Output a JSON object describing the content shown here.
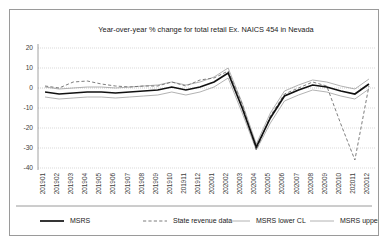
{
  "chart_data": {
    "type": "line",
    "title": "Year-over-year % change for total retail Ex. NAICS 454 in Nevada",
    "xlabel": "",
    "ylabel": "",
    "ylim": [
      -40,
      20
    ],
    "yticks": [
      20,
      10,
      0,
      -10,
      -20,
      -30,
      -40
    ],
    "ytick_labels": [
      "20",
      "10",
      "0",
      "-10",
      "-20",
      "-30",
      "-40"
    ],
    "grid": true,
    "legend_position": "bottom",
    "categories": [
      "201901",
      "201902",
      "201903",
      "201904",
      "201905",
      "201906",
      "201907",
      "201908",
      "201909",
      "201910",
      "201911",
      "201912",
      "202001",
      "202002",
      "202003",
      "202004",
      "202005",
      "202006",
      "202007",
      "202008",
      "202009",
      "202010",
      "202011",
      "202012"
    ],
    "series": [
      {
        "name": "MSRS",
        "style": "solid-thick",
        "color": "#111111",
        "values": [
          -2.0,
          -3.0,
          -2.5,
          -2.0,
          -2.0,
          -2.5,
          -2.0,
          -1.5,
          -1.0,
          0.5,
          -1.0,
          0.5,
          3.0,
          7.5,
          -10.0,
          -29.5,
          -15.0,
          -4.0,
          -1.0,
          1.5,
          0.5,
          -1.5,
          -3.0,
          2.0
        ]
      },
      {
        "name": "State revenue data",
        "style": "dashed",
        "color": "#6e6e6e",
        "values": [
          1.0,
          0.0,
          3.0,
          3.5,
          2.0,
          1.0,
          0.5,
          1.0,
          1.0,
          3.0,
          1.0,
          4.0,
          5.0,
          8.5,
          -8.0,
          -31.0,
          -14.0,
          -3.0,
          0.0,
          3.0,
          1.0,
          -18.0,
          -36.0,
          1.0
        ]
      },
      {
        "name": "MSRS lower CL",
        "style": "solid-thin",
        "color": "#9e9e9e",
        "values": [
          -4.5,
          -5.5,
          -5.0,
          -4.5,
          -4.5,
          -5.0,
          -4.5,
          -4.0,
          -3.5,
          -2.0,
          -3.5,
          -2.0,
          0.5,
          5.0,
          -12.5,
          -31.0,
          -17.5,
          -6.5,
          -3.5,
          -1.0,
          -2.0,
          -4.0,
          -5.5,
          -0.5
        ]
      },
      {
        "name": "MSRS upper CL",
        "style": "solid-thin",
        "color": "#9e9e9e",
        "values": [
          0.5,
          -0.5,
          0.0,
          0.5,
          0.5,
          0.0,
          0.5,
          1.0,
          1.5,
          3.0,
          1.5,
          3.0,
          5.5,
          10.0,
          -7.5,
          -28.0,
          -12.5,
          -1.5,
          1.5,
          4.0,
          3.0,
          1.0,
          -0.5,
          4.5
        ]
      }
    ]
  },
  "legend": {
    "items": [
      {
        "label": "MSRS",
        "style": "solid-thick",
        "color": "#111111"
      },
      {
        "label": "State revenue data",
        "style": "dashed",
        "color": "#6e6e6e"
      },
      {
        "label": "MSRS lower CL",
        "style": "solid-thin",
        "color": "#9e9e9e"
      },
      {
        "label": "MSRS upper CL",
        "style": "solid-thin",
        "color": "#9e9e9e"
      }
    ]
  }
}
